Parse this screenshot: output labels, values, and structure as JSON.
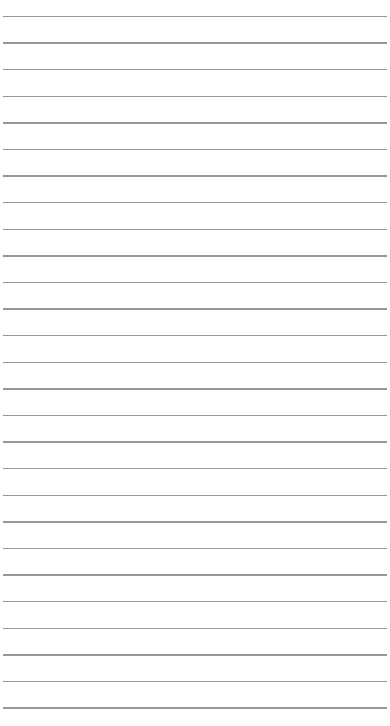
{
  "page": {
    "type": "ruled-paper",
    "background_color": "#ffffff",
    "line_color": "#8c8c8c",
    "line_count": 27,
    "first_line_y": 16.5,
    "line_spacing": 26.6,
    "line_left": 3,
    "line_right": 387
  }
}
